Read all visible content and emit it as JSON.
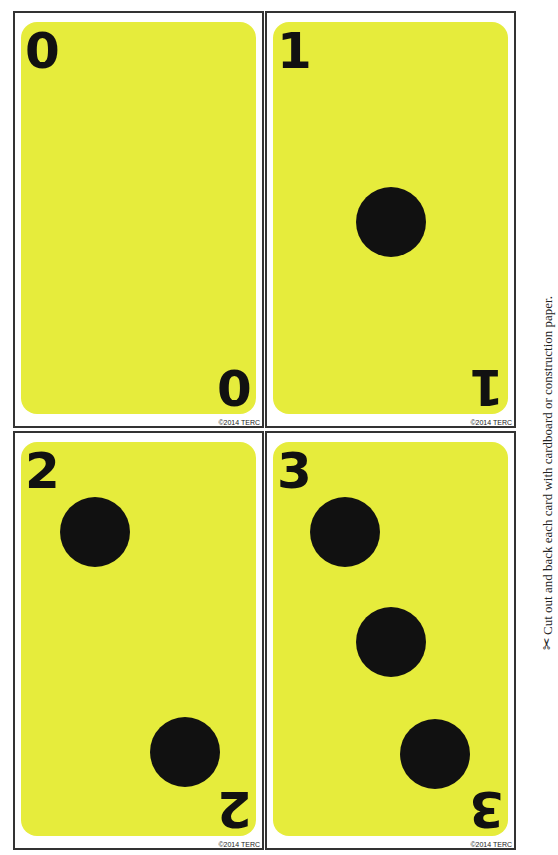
{
  "cards": [
    {
      "number": "0",
      "dots": 0,
      "copyright": "©2014 TERC"
    },
    {
      "number": "1",
      "dots": 1,
      "copyright": "©2014 TERC"
    },
    {
      "number": "2",
      "dots": 2,
      "copyright": "©2014 TERC"
    },
    {
      "number": "3",
      "dots": 3,
      "copyright": "©2014 TERC"
    }
  ],
  "instruction": {
    "icon": "scissors-icon",
    "glyph": "✂",
    "text": "Cut out and back each card with cardboard or construction paper."
  },
  "colors": {
    "card_face": "#e6ec3c",
    "dot": "#111111",
    "border": "#333333"
  }
}
